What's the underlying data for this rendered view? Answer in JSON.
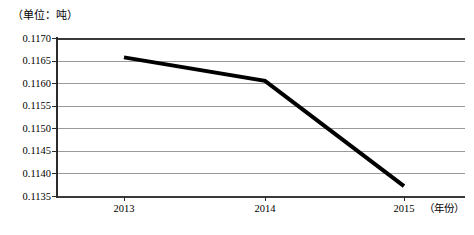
{
  "chart_data": {
    "type": "line",
    "title": "",
    "unit_label": "（单位：吨）",
    "xlabel": "（年份）",
    "ylabel": "",
    "categories": [
      "2013",
      "2014",
      "2015"
    ],
    "x": [
      2013,
      2014,
      2015
    ],
    "values": [
      0.11657,
      0.11605,
      0.11372
    ],
    "series": [
      {
        "name": "",
        "values": [
          0.11657,
          0.11605,
          0.11372
        ],
        "color": "#000000",
        "line_width": 4
      }
    ],
    "ylim": [
      0.1135,
      0.117
    ],
    "ytick_labels": [
      "0.1170",
      "0.1165",
      "0.1160",
      "0.1155",
      "0.1150",
      "0.1145",
      "0.1140",
      "0.1135"
    ],
    "ytick_values": [
      0.117,
      0.1165,
      0.116,
      0.1155,
      0.115,
      0.1145,
      0.114,
      0.1135
    ],
    "xtick_labels": [
      "2013",
      "2014",
      "2015"
    ],
    "grid": true,
    "grid_color": "#9a9a9a",
    "legend": false,
    "legend_position": "none",
    "markers": false
  },
  "caption": {
    "text": ""
  }
}
